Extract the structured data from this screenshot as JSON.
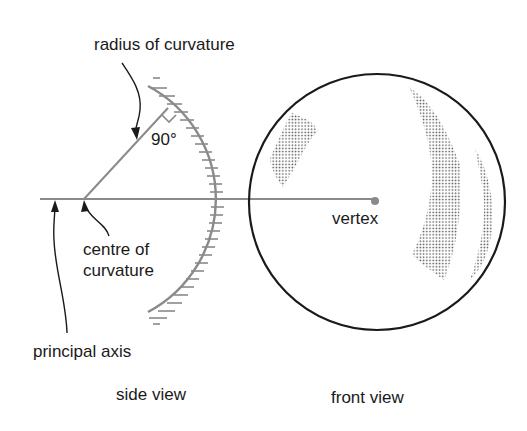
{
  "labels": {
    "radius": "radius of curvature",
    "angle": "90°",
    "centre_line1": "centre of",
    "centre_line2": "curvature",
    "principal_axis": "principal axis",
    "vertex": "vertex",
    "side_view": "side view",
    "front_view": "front view"
  },
  "colors": {
    "mirror": "#8a8a8a",
    "axis": "#8a8a8a",
    "outline": "#1a1a1a",
    "stipple": "#555555",
    "text": "#1a1a1a"
  }
}
